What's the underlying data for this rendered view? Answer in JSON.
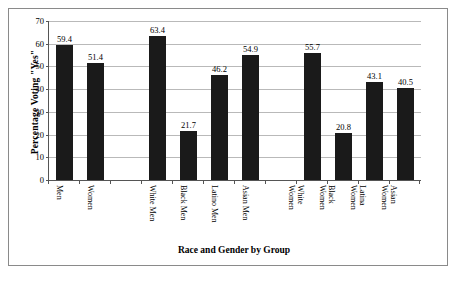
{
  "chart_data": {
    "type": "bar",
    "title": "",
    "xlabel": "Race and Gender by Group",
    "ylabel": "Percentage Voting \"Yes\"",
    "ylim": [
      0,
      70
    ],
    "yticks": [
      0,
      10,
      20,
      30,
      40,
      50,
      60,
      70
    ],
    "ytick_labels": [
      "0",
      "10",
      "20",
      "30",
      "40",
      "50",
      "60",
      "70"
    ],
    "grid": "horizontal",
    "legend": "none",
    "bar_color": "#1a1a1a",
    "categories": [
      "Men",
      "Women",
      "",
      "White Men",
      "Black Men",
      "Latino Men",
      "Asian Men",
      "",
      "White Women",
      "Black Women",
      "Latina Women",
      "Asian Women"
    ],
    "values": [
      59.4,
      51.4,
      null,
      63.4,
      21.7,
      46.2,
      54.9,
      null,
      55.7,
      20.8,
      43.1,
      40.5
    ],
    "data_labels": [
      "59.4",
      "51.4",
      "",
      "63.4",
      "21.7",
      "46.2",
      "54.9",
      "",
      "55.7",
      "20.8",
      "43.1",
      "40.5"
    ],
    "bars": [
      {
        "label_line1": "Men",
        "label_line2": "",
        "value": 59.4,
        "value_label": "59.4",
        "empty": false
      },
      {
        "label_line1": "Women",
        "label_line2": "",
        "value": 51.4,
        "value_label": "51.4",
        "empty": false
      },
      {
        "label_line1": "",
        "label_line2": "",
        "value": null,
        "value_label": "",
        "empty": true
      },
      {
        "label_line1": "White Men",
        "label_line2": "",
        "value": 63.4,
        "value_label": "63.4",
        "empty": false
      },
      {
        "label_line1": "Black Men",
        "label_line2": "",
        "value": 21.7,
        "value_label": "21.7",
        "empty": false
      },
      {
        "label_line1": "Latino Men",
        "label_line2": "",
        "value": 46.2,
        "value_label": "46.2",
        "empty": false
      },
      {
        "label_line1": "Asian Men",
        "label_line2": "",
        "value": 54.9,
        "value_label": "54.9",
        "empty": false
      },
      {
        "label_line1": "",
        "label_line2": "",
        "value": null,
        "value_label": "",
        "empty": true
      },
      {
        "label_line1": "White",
        "label_line2": "Women",
        "value": 55.7,
        "value_label": "55.7",
        "empty": false
      },
      {
        "label_line1": "Black",
        "label_line2": "Women",
        "value": 20.8,
        "value_label": "20.8",
        "empty": false
      },
      {
        "label_line1": "Latina",
        "label_line2": "Women",
        "value": 43.1,
        "value_label": "43.1",
        "empty": false
      },
      {
        "label_line1": "Asian",
        "label_line2": "Women",
        "value": 40.5,
        "value_label": "40.5",
        "empty": false
      }
    ]
  }
}
